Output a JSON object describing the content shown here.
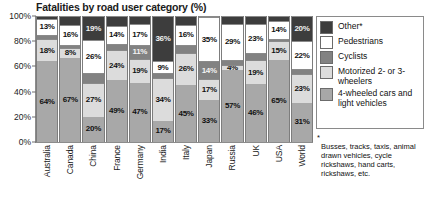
{
  "chart_data": {
    "type": "bar",
    "subtype": "stacked-bar-100",
    "title": "Fatalities by road user category (%)",
    "xlabel": "",
    "ylabel": "",
    "ylim": [
      0,
      100
    ],
    "grid": false,
    "legend_position": "right",
    "y_ticks": [
      "0%",
      "20%",
      "40%",
      "60%",
      "80%",
      "100%"
    ],
    "y_tick_values": [
      0,
      20,
      40,
      60,
      80,
      100
    ],
    "categories": [
      "Australia",
      "Canada",
      "China",
      "France",
      "Germany",
      "India",
      "Italy",
      "Japan",
      "Russia",
      "UK",
      "USA",
      "World"
    ],
    "series": [
      {
        "name": "4-wheeled cars and light vehicles",
        "color": "#a8a8a8",
        "values": [
          64,
          67,
          20,
          49,
          47,
          17,
          45,
          33,
          57,
          46,
          65,
          31
        ],
        "labels": [
          "64%",
          "67%",
          "20%",
          "49%",
          "47%",
          "17%",
          "45%",
          "33%",
          "57%",
          "46%",
          "65%",
          "31%"
        ]
      },
      {
        "name": "Motorized 2- or 3-wheelers",
        "color": "#dcdcdc",
        "values": [
          18,
          8,
          27,
          24,
          19,
          34,
          26,
          17,
          4,
          19,
          15,
          23
        ],
        "labels": [
          "18%",
          "8%",
          "27%",
          "24%",
          "19%",
          "34%",
          "26%",
          "17%",
          "4%",
          "19%",
          "15%",
          "23%"
        ]
      },
      {
        "name": "Cyclists",
        "color": "#828282",
        "values": [
          3,
          2,
          8,
          5,
          11,
          4,
          6,
          14,
          4,
          6,
          2,
          4
        ],
        "labels": [
          "",
          "",
          "",
          "",
          "11%",
          "",
          "",
          "14%",
          "",
          "",
          "",
          ""
        ]
      },
      {
        "name": "Pedestrians",
        "color": "#ffffff",
        "values": [
          13,
          16,
          26,
          14,
          17,
          9,
          16,
          35,
          29,
          23,
          14,
          22
        ],
        "labels": [
          "13%",
          "16%",
          "26%",
          "14%",
          "17%",
          "9%",
          "16%",
          "35%",
          "29%",
          "23%",
          "14%",
          "22%"
        ]
      },
      {
        "name": "Other*",
        "color": "#3d3d3d",
        "values": [
          2,
          7,
          19,
          8,
          6,
          36,
          7,
          1,
          6,
          6,
          4,
          20
        ],
        "labels": [
          "",
          "",
          "19%",
          "",
          "",
          "36%",
          "",
          "",
          "",
          "",
          "",
          "20%"
        ]
      }
    ]
  },
  "legend": {
    "items": [
      {
        "label": "Other*",
        "color": "#3d3d3d"
      },
      {
        "label": "Pedestrians",
        "color": "#ffffff"
      },
      {
        "label": "Cyclists",
        "color": "#828282"
      },
      {
        "label": "Motorized 2- or 3-wheelers",
        "color": "#dcdcdc"
      },
      {
        "label": "4-wheeled cars and light vehicles",
        "color": "#a8a8a8"
      }
    ]
  },
  "footnote": {
    "marker": "*",
    "text": "Busses, tracks, taxis, animal drawn vehicles, cycle rickshaws, hand carts, rickshaws, etc."
  }
}
